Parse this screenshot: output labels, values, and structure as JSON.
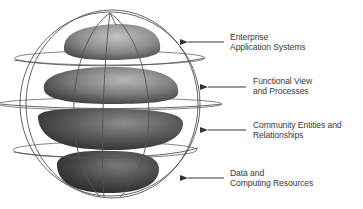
{
  "diagram": {
    "type": "layered-sphere",
    "layers": [
      {
        "id": "enterprise",
        "line1": "Enterprise",
        "line2": "Application Systems",
        "shade": "#8a8a8a"
      },
      {
        "id": "functional",
        "line1": "Functional View",
        "line2": "and Processes",
        "shade": "#6e6e6e"
      },
      {
        "id": "community",
        "line1": "Community Entities and",
        "line2": "Relationships",
        "shade": "#4a4a4a"
      },
      {
        "id": "data",
        "line1": "Data and",
        "line2": "Computing Resources",
        "shade": "#3a3a3a"
      }
    ],
    "colors": {
      "wireframe": "#555555",
      "arrow": "#333333",
      "text": "#3a3a3a"
    }
  }
}
